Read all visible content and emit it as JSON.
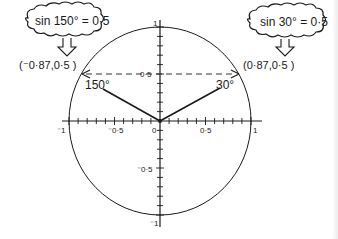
{
  "diagram": {
    "type": "unit-circle",
    "title": "",
    "axis_labels": {
      "x_neg1": "⁻1",
      "x_neg05": "⁻0·5",
      "origin": "0",
      "x_05": "0·5",
      "x_1": "1",
      "y_1": "1",
      "y_05": "0·5",
      "y_neg05": "⁻0·5",
      "y_neg1": "⁻1"
    },
    "angles": [
      {
        "label": "150°",
        "degrees": 150,
        "point_label": "(⁻0·87,0·5 )",
        "callout": "sin 150° = 0·5"
      },
      {
        "label": "30°",
        "degrees": 30,
        "point_label": "(0·87,0·5 )",
        "callout": "sin 30° = 0·5"
      }
    ],
    "dashed_line_y": 0.5,
    "tick_step": 0.1,
    "colors": {
      "ink": "#1a1a1a",
      "dashed": "#333333",
      "background": "#ffffff"
    }
  }
}
